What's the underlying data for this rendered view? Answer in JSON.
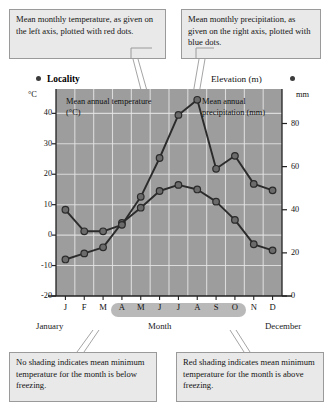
{
  "callouts": {
    "temperature": "Mean monthly temperature, as given on the left axis, plotted with red dots.",
    "precipitation": "Mean monthly precipitation, as given on the right axis, plotted with blue dots.",
    "no_shading": "No shading indicates mean minimum temperature for the month is below freezing.",
    "red_shading": "Red shading indicates mean minimum temperature for the month is above freezing."
  },
  "header": {
    "locality": "Locality",
    "elevation": "Elevation (m)",
    "left_unit": "°C",
    "right_unit": "mm"
  },
  "notes": {
    "temp_series": "Mean annual temperature (°C)",
    "precip_series": "Mean annual precipitation (mm)"
  },
  "axis_captions": {
    "january": "January",
    "month": "Month",
    "december": "December"
  },
  "colors": {
    "plot_background": "#9d9d9d",
    "gridline": "#e6e6e6",
    "series_line": "#2b2b2b",
    "series_marker": "#6b6b6b",
    "callout_bg": "#e9e9e9",
    "callout_border": "#9a9a9a",
    "shade_band": "#b9b9b9"
  },
  "chart_data": {
    "type": "line",
    "title": "Locality",
    "xlabel": "Month",
    "categories": [
      "J",
      "F",
      "M",
      "A",
      "M",
      "J",
      "J",
      "A",
      "S",
      "O",
      "N",
      "D"
    ],
    "month_names": [
      "January",
      "February",
      "March",
      "April",
      "May",
      "June",
      "July",
      "August",
      "September",
      "October",
      "November",
      "December"
    ],
    "grid": true,
    "legend": "none",
    "axes": {
      "left": {
        "label": "°C",
        "ticks": [
          40,
          30,
          20,
          10,
          0,
          -10,
          -20
        ],
        "range": [
          -20,
          48
        ]
      },
      "right": {
        "label": "mm",
        "ticks": [
          80,
          60,
          40,
          20,
          0
        ],
        "range": [
          0,
          96
        ]
      }
    },
    "series": [
      {
        "name": "Mean annual temperature (°C)",
        "axis": "left",
        "unit": "°C",
        "marker": "red dots",
        "values": [
          -8,
          -6,
          -4,
          4,
          9,
          14.5,
          16.5,
          15,
          11,
          5,
          -3,
          -5
        ]
      },
      {
        "name": "Mean annual precipitation (mm)",
        "axis": "right",
        "unit": "mm",
        "marker": "blue dots",
        "values": [
          40,
          30,
          30,
          33,
          46,
          64,
          84,
          91,
          59,
          65,
          52,
          49
        ]
      }
    ],
    "shading": {
      "label": "Red shading indicates mean minimum temperature above freezing",
      "months": [
        "A",
        "M",
        "J",
        "J",
        "A",
        "S",
        "O"
      ],
      "start_index": 3,
      "end_index": 9
    }
  }
}
